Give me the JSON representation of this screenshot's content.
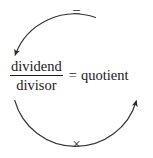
{
  "diagram": {
    "stroke_color": "#333333",
    "text_color": "#1a1a1a",
    "background_color": "#ffffff",
    "top_operator": "=",
    "bottom_operator": "×",
    "equation": {
      "numerator": "dividend",
      "denominator": "divisor",
      "relation": "=",
      "result": "quotient"
    },
    "arcs": [
      {
        "name": "top-arc",
        "direction": "counterclockwise",
        "arrow_at": "left",
        "arrow_points": "down-left",
        "gap_at": "top"
      },
      {
        "name": "bottom-arc",
        "direction": "counterclockwise",
        "arrow_at": "right",
        "arrow_points": "up-right",
        "gap_at": "bottom"
      }
    ]
  }
}
